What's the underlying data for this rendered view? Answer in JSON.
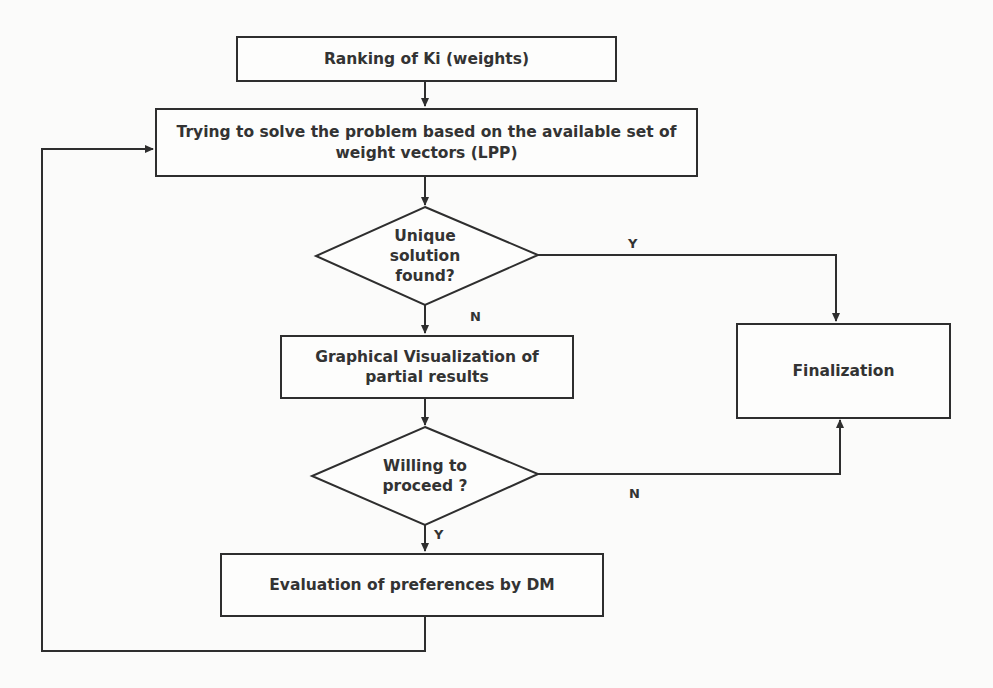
{
  "diagram": {
    "type": "flowchart",
    "nodes": {
      "ranking": {
        "shape": "process",
        "text": "Ranking of Ki (weights)"
      },
      "solve": {
        "shape": "process",
        "line1": "Trying to solve the problem based on the available set of",
        "line2": "weight vectors (LPP)"
      },
      "unique": {
        "shape": "decision",
        "line1": "Unique",
        "line2": "solution",
        "line3": "found?"
      },
      "visualization": {
        "shape": "process",
        "line1": "Graphical Visualization of",
        "line2": "partial results"
      },
      "willing": {
        "shape": "decision",
        "line1": "Willing to",
        "line2": "proceed ?"
      },
      "evaluation": {
        "shape": "process",
        "text": "Evaluation of preferences by DM"
      },
      "finalization": {
        "shape": "process",
        "text": "Finalization"
      }
    },
    "edges": [
      {
        "from": "ranking",
        "to": "solve",
        "label": ""
      },
      {
        "from": "solve",
        "to": "unique",
        "label": ""
      },
      {
        "from": "unique",
        "to": "finalization",
        "label": "Y"
      },
      {
        "from": "unique",
        "to": "visualization",
        "label": "N"
      },
      {
        "from": "visualization",
        "to": "willing",
        "label": ""
      },
      {
        "from": "willing",
        "to": "evaluation",
        "label": "Y"
      },
      {
        "from": "willing",
        "to": "finalization",
        "label": "N"
      },
      {
        "from": "evaluation",
        "to": "solve",
        "label": ""
      }
    ],
    "labels": {
      "unique_yes": "Y",
      "unique_no": "N",
      "willing_yes": "Y",
      "willing_no": "N"
    },
    "colors": {
      "stroke": "#2e2e2e",
      "text": "#333333",
      "background": "#fbfbfa"
    }
  }
}
